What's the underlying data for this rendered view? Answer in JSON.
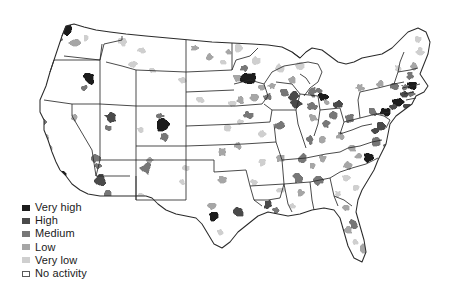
{
  "figure": {
    "type": "choropleth-map",
    "region": "United States (contiguous 48 states, county level)",
    "background_color": "#ffffff",
    "outline_color": "#2b2b2b",
    "title": ""
  },
  "legend": {
    "name": "activity-level-legend",
    "position": "bottom-left",
    "items": [
      {
        "label": "Very high",
        "color": "#1c1c1c",
        "rank": 5
      },
      {
        "label": "High",
        "color": "#4a4a4a",
        "rank": 4
      },
      {
        "label": "Medium",
        "color": "#777777",
        "rank": 3
      },
      {
        "label": "Low",
        "color": "#a6a6a6",
        "rank": 2
      },
      {
        "label": "Very low",
        "color": "#cfcfcf",
        "rank": 1
      },
      {
        "label": "No activity",
        "color": "#ffffff",
        "rank": 0
      }
    ]
  },
  "chart_data": {
    "type": "heatmap",
    "title": "",
    "xlabel": "",
    "ylabel": "",
    "legend_position": "bottom-left",
    "scale_labels": [
      "Very high",
      "High",
      "Medium",
      "Low",
      "Very low",
      "No activity"
    ],
    "scale_colors": [
      "#1c1c1c",
      "#4a4a4a",
      "#777777",
      "#a6a6a6",
      "#cfcfcf",
      "#ffffff"
    ],
    "default_level": "No activity",
    "regions": [
      {
        "name": "Seattle WA",
        "x": 64,
        "y": 28,
        "level": "Very high",
        "w": 14,
        "h": 14
      },
      {
        "name": "Puget Sound WA",
        "x": 58,
        "y": 40,
        "level": "Medium",
        "w": 11,
        "h": 8
      },
      {
        "name": "Portland OR",
        "x": 50,
        "y": 50,
        "level": "High",
        "w": 12,
        "h": 9
      },
      {
        "name": "Willamette OR",
        "x": 44,
        "y": 58,
        "level": "Medium",
        "w": 8,
        "h": 10
      },
      {
        "name": "Central WA",
        "x": 75,
        "y": 43,
        "level": "Low",
        "w": 12,
        "h": 7
      },
      {
        "name": "Spokane WA",
        "x": 86,
        "y": 38,
        "level": "Very low",
        "w": 7,
        "h": 6
      },
      {
        "name": "Boise ID",
        "x": 89,
        "y": 78,
        "level": "Very high",
        "w": 12,
        "h": 13
      },
      {
        "name": "SW Idaho",
        "x": 84,
        "y": 88,
        "level": "Medium",
        "w": 7,
        "h": 6
      },
      {
        "name": "Western MT",
        "x": 123,
        "y": 42,
        "level": "Very low",
        "w": 10,
        "h": 8
      },
      {
        "name": "Central MT",
        "x": 142,
        "y": 50,
        "level": "Very low",
        "w": 9,
        "h": 7
      },
      {
        "name": "Eastern MT",
        "x": 133,
        "y": 64,
        "level": "Very low",
        "w": 10,
        "h": 7
      },
      {
        "name": "Billings MT",
        "x": 152,
        "y": 70,
        "level": "Very low",
        "w": 7,
        "h": 6
      },
      {
        "name": "Western ND",
        "x": 195,
        "y": 48,
        "level": "Low",
        "w": 8,
        "h": 6
      },
      {
        "name": "Bismarck ND",
        "x": 210,
        "y": 57,
        "level": "Low",
        "w": 8,
        "h": 7
      },
      {
        "name": "Fargo ND",
        "x": 228,
        "y": 52,
        "level": "Low",
        "w": 7,
        "h": 6
      },
      {
        "name": "NE Montana",
        "x": 223,
        "y": 62,
        "level": "Very low",
        "w": 7,
        "h": 5
      },
      {
        "name": "Rapid City SD",
        "x": 182,
        "y": 80,
        "level": "Very low",
        "w": 8,
        "h": 6
      },
      {
        "name": "Sioux Falls SD",
        "x": 237,
        "y": 78,
        "level": "Low",
        "w": 9,
        "h": 8
      },
      {
        "name": "Minneapolis MN",
        "x": 248,
        "y": 78,
        "level": "Very high",
        "w": 15,
        "h": 13
      },
      {
        "name": "St Cloud MN",
        "x": 244,
        "y": 68,
        "level": "Medium",
        "w": 8,
        "h": 7
      },
      {
        "name": "Duluth MN",
        "x": 256,
        "y": 60,
        "level": "Very low",
        "w": 9,
        "h": 8
      },
      {
        "name": "NW Minnesota",
        "x": 238,
        "y": 48,
        "level": "Very low",
        "w": 9,
        "h": 9
      },
      {
        "name": "Rochester MN",
        "x": 262,
        "y": 88,
        "level": "Low",
        "w": 8,
        "h": 6
      },
      {
        "name": "La Crosse WI",
        "x": 272,
        "y": 86,
        "level": "Low",
        "w": 8,
        "h": 6
      },
      {
        "name": "Madison WI",
        "x": 284,
        "y": 92,
        "level": "Medium",
        "w": 9,
        "h": 8
      },
      {
        "name": "Milwaukee WI",
        "x": 294,
        "y": 96,
        "level": "High",
        "w": 10,
        "h": 9
      },
      {
        "name": "Green Bay WI",
        "x": 292,
        "y": 80,
        "level": "Low",
        "w": 8,
        "h": 7
      },
      {
        "name": "Northern WI",
        "x": 280,
        "y": 68,
        "level": "Very low",
        "w": 10,
        "h": 8
      },
      {
        "name": "Upper Peninsula MI",
        "x": 300,
        "y": 66,
        "level": "Very low",
        "w": 11,
        "h": 7
      },
      {
        "name": "Grand Rapids MI",
        "x": 312,
        "y": 92,
        "level": "Medium",
        "w": 9,
        "h": 9
      },
      {
        "name": "Detroit MI",
        "x": 323,
        "y": 97,
        "level": "Very high",
        "w": 10,
        "h": 9
      },
      {
        "name": "Lansing MI",
        "x": 318,
        "y": 90,
        "level": "Medium",
        "w": 7,
        "h": 6
      },
      {
        "name": "Chicago IL",
        "x": 296,
        "y": 104,
        "level": "High",
        "w": 11,
        "h": 10
      },
      {
        "name": "Northern IN",
        "x": 312,
        "y": 106,
        "level": "Medium",
        "w": 10,
        "h": 8
      },
      {
        "name": "Indianapolis IN",
        "x": 313,
        "y": 118,
        "level": "Low",
        "w": 9,
        "h": 8
      },
      {
        "name": "Cincinnati OH",
        "x": 326,
        "y": 124,
        "level": "Medium",
        "w": 9,
        "h": 8
      },
      {
        "name": "Columbus OH",
        "x": 334,
        "y": 115,
        "level": "Medium",
        "w": 9,
        "h": 8
      },
      {
        "name": "Cleveland OH",
        "x": 338,
        "y": 104,
        "level": "High",
        "w": 10,
        "h": 8
      },
      {
        "name": "Toledo OH",
        "x": 326,
        "y": 102,
        "level": "Low",
        "w": 7,
        "h": 6
      },
      {
        "name": "Des Moines IA",
        "x": 254,
        "y": 97,
        "level": "Low",
        "w": 9,
        "h": 8
      },
      {
        "name": "Cedar Rapids IA",
        "x": 268,
        "y": 97,
        "level": "Medium",
        "w": 8,
        "h": 7
      },
      {
        "name": "Omaha NE",
        "x": 240,
        "y": 100,
        "level": "Low",
        "w": 8,
        "h": 7
      },
      {
        "name": "Lincoln NE",
        "x": 232,
        "y": 104,
        "level": "Very low",
        "w": 8,
        "h": 6
      },
      {
        "name": "Western NE",
        "x": 200,
        "y": 100,
        "level": "Very low",
        "w": 8,
        "h": 6
      },
      {
        "name": "Kansas City MO",
        "x": 248,
        "y": 115,
        "level": "Medium",
        "w": 9,
        "h": 8
      },
      {
        "name": "Wichita KS",
        "x": 228,
        "y": 128,
        "level": "Very low",
        "w": 8,
        "h": 6
      },
      {
        "name": "Topeka KS",
        "x": 240,
        "y": 122,
        "level": "Very low",
        "w": 7,
        "h": 6
      },
      {
        "name": "St Louis MO",
        "x": 280,
        "y": 126,
        "level": "Medium",
        "w": 10,
        "h": 9
      },
      {
        "name": "Springfield MO",
        "x": 262,
        "y": 134,
        "level": "Very low",
        "w": 8,
        "h": 7
      },
      {
        "name": "Denver CO",
        "x": 162,
        "y": 124,
        "level": "Very high",
        "w": 13,
        "h": 14
      },
      {
        "name": "Colorado Springs",
        "x": 164,
        "y": 138,
        "level": "Medium",
        "w": 9,
        "h": 8
      },
      {
        "name": "Fort Collins CO",
        "x": 160,
        "y": 116,
        "level": "Medium",
        "w": 8,
        "h": 6
      },
      {
        "name": "Grand Junction CO",
        "x": 140,
        "y": 130,
        "level": "Very low",
        "w": 7,
        "h": 6
      },
      {
        "name": "Salt Lake City UT",
        "x": 110,
        "y": 118,
        "level": "High",
        "w": 11,
        "h": 10
      },
      {
        "name": "Provo UT",
        "x": 108,
        "y": 128,
        "level": "Medium",
        "w": 7,
        "h": 6
      },
      {
        "name": "Reno NV",
        "x": 74,
        "y": 118,
        "level": "Low",
        "w": 8,
        "h": 7
      },
      {
        "name": "Las Vegas NV",
        "x": 96,
        "y": 158,
        "level": "Medium",
        "w": 9,
        "h": 8
      },
      {
        "name": "Sacramento CA",
        "x": 42,
        "y": 122,
        "level": "Medium",
        "w": 9,
        "h": 9
      },
      {
        "name": "San Francisco CA",
        "x": 31,
        "y": 130,
        "level": "Very high",
        "w": 10,
        "h": 14
      },
      {
        "name": "San Jose CA",
        "x": 38,
        "y": 143,
        "level": "High",
        "w": 8,
        "h": 8
      },
      {
        "name": "Fresno CA",
        "x": 48,
        "y": 150,
        "level": "Low",
        "w": 9,
        "h": 9
      },
      {
        "name": "Central Valley CA",
        "x": 44,
        "y": 138,
        "level": "Low",
        "w": 8,
        "h": 8
      },
      {
        "name": "Los Angeles CA",
        "x": 50,
        "y": 162,
        "level": "High",
        "w": 12,
        "h": 11
      },
      {
        "name": "San Diego CA",
        "x": 62,
        "y": 176,
        "level": "Very high",
        "w": 10,
        "h": 9
      },
      {
        "name": "Santa Barbara CA",
        "x": 44,
        "y": 170,
        "level": "Medium",
        "w": 7,
        "h": 6
      },
      {
        "name": "Phoenix AZ",
        "x": 100,
        "y": 180,
        "level": "High",
        "w": 13,
        "h": 12
      },
      {
        "name": "Tucson AZ",
        "x": 108,
        "y": 194,
        "level": "Medium",
        "w": 9,
        "h": 8
      },
      {
        "name": "Flagstaff AZ",
        "x": 98,
        "y": 166,
        "level": "Medium",
        "w": 8,
        "h": 6
      },
      {
        "name": "Albuquerque NM",
        "x": 146,
        "y": 168,
        "level": "Medium",
        "w": 11,
        "h": 12
      },
      {
        "name": "Santa Fe NM",
        "x": 150,
        "y": 160,
        "level": "Low",
        "w": 7,
        "h": 6
      },
      {
        "name": "Las Cruces NM",
        "x": 140,
        "y": 196,
        "level": "Very low",
        "w": 8,
        "h": 7
      },
      {
        "name": "El Paso TX",
        "x": 150,
        "y": 200,
        "level": "Very low",
        "w": 7,
        "h": 6
      },
      {
        "name": "Amarillo TX",
        "x": 186,
        "y": 168,
        "level": "Very low",
        "w": 8,
        "h": 6
      },
      {
        "name": "Lubbock TX",
        "x": 182,
        "y": 182,
        "level": "Very low",
        "w": 7,
        "h": 6
      },
      {
        "name": "Oklahoma City OK",
        "x": 222,
        "y": 152,
        "level": "Low",
        "w": 9,
        "h": 8
      },
      {
        "name": "Tulsa OK",
        "x": 238,
        "y": 146,
        "level": "Low",
        "w": 8,
        "h": 7
      },
      {
        "name": "Dallas TX",
        "x": 222,
        "y": 180,
        "level": "Low",
        "w": 9,
        "h": 8
      },
      {
        "name": "Austin TX",
        "x": 212,
        "y": 206,
        "level": "Low",
        "w": 8,
        "h": 7
      },
      {
        "name": "San Antonio TX",
        "x": 214,
        "y": 216,
        "level": "Very high",
        "w": 10,
        "h": 9
      },
      {
        "name": "Houston TX",
        "x": 238,
        "y": 212,
        "level": "High",
        "w": 11,
        "h": 10
      },
      {
        "name": "Corpus Christi TX",
        "x": 220,
        "y": 232,
        "level": "Very low",
        "w": 7,
        "h": 6
      },
      {
        "name": "Little Rock AR",
        "x": 262,
        "y": 162,
        "level": "Very low",
        "w": 8,
        "h": 7
      },
      {
        "name": "Shreveport LA",
        "x": 254,
        "y": 182,
        "level": "Very low",
        "w": 7,
        "h": 6
      },
      {
        "name": "Baton Rouge LA",
        "x": 268,
        "y": 204,
        "level": "High",
        "w": 9,
        "h": 8
      },
      {
        "name": "New Orleans LA",
        "x": 276,
        "y": 210,
        "level": "Medium",
        "w": 9,
        "h": 7
      },
      {
        "name": "Jackson MS",
        "x": 280,
        "y": 190,
        "level": "Very low",
        "w": 8,
        "h": 7
      },
      {
        "name": "Memphis TN",
        "x": 280,
        "y": 158,
        "level": "Low",
        "w": 9,
        "h": 8
      },
      {
        "name": "Nashville TN",
        "x": 302,
        "y": 158,
        "level": "Medium",
        "w": 10,
        "h": 8
      },
      {
        "name": "Knoxville TN",
        "x": 322,
        "y": 158,
        "level": "Low",
        "w": 8,
        "h": 7
      },
      {
        "name": "Chattanooga TN",
        "x": 312,
        "y": 166,
        "level": "Low",
        "w": 7,
        "h": 6
      },
      {
        "name": "Birmingham AL",
        "x": 298,
        "y": 178,
        "level": "Medium",
        "w": 10,
        "h": 10
      },
      {
        "name": "Montgomery AL",
        "x": 300,
        "y": 192,
        "level": "Low",
        "w": 8,
        "h": 7
      },
      {
        "name": "Mobile AL",
        "x": 292,
        "y": 206,
        "level": "Very low",
        "w": 7,
        "h": 6
      },
      {
        "name": "Atlanta GA",
        "x": 318,
        "y": 180,
        "level": "Medium",
        "w": 10,
        "h": 9
      },
      {
        "name": "Savannah GA",
        "x": 338,
        "y": 194,
        "level": "Very low",
        "w": 7,
        "h": 6
      },
      {
        "name": "Louisville KY",
        "x": 310,
        "y": 140,
        "level": "Medium",
        "w": 9,
        "h": 8
      },
      {
        "name": "Lexington KY",
        "x": 322,
        "y": 140,
        "level": "Low",
        "w": 8,
        "h": 7
      },
      {
        "name": "Charleston WV",
        "x": 340,
        "y": 136,
        "level": "Low",
        "w": 8,
        "h": 7
      },
      {
        "name": "Pittsburgh PA",
        "x": 350,
        "y": 118,
        "level": "Medium",
        "w": 10,
        "h": 9
      },
      {
        "name": "Harrisburg PA",
        "x": 372,
        "y": 112,
        "level": "Medium",
        "w": 9,
        "h": 8
      },
      {
        "name": "Philadelphia PA",
        "x": 386,
        "y": 112,
        "level": "Very high",
        "w": 11,
        "h": 10
      },
      {
        "name": "Baltimore MD",
        "x": 380,
        "y": 126,
        "level": "High",
        "w": 9,
        "h": 8
      },
      {
        "name": "Washington DC",
        "x": 374,
        "y": 131,
        "level": "High",
        "w": 8,
        "h": 7
      },
      {
        "name": "Richmond VA",
        "x": 376,
        "y": 142,
        "level": "Medium",
        "w": 9,
        "h": 8
      },
      {
        "name": "Norfolk VA",
        "x": 386,
        "y": 146,
        "level": "Medium",
        "w": 8,
        "h": 7
      },
      {
        "name": "Roanoke VA",
        "x": 352,
        "y": 148,
        "level": "Low",
        "w": 8,
        "h": 7
      },
      {
        "name": "Raleigh NC",
        "x": 368,
        "y": 158,
        "level": "Very high",
        "w": 10,
        "h": 9
      },
      {
        "name": "Charlotte NC",
        "x": 348,
        "y": 166,
        "level": "Low",
        "w": 9,
        "h": 8
      },
      {
        "name": "Greensboro NC",
        "x": 358,
        "y": 156,
        "level": "Low",
        "w": 8,
        "h": 6
      },
      {
        "name": "Columbia SC",
        "x": 346,
        "y": 178,
        "level": "Very low",
        "w": 8,
        "h": 7
      },
      {
        "name": "Charleston SC",
        "x": 356,
        "y": 188,
        "level": "Very low",
        "w": 7,
        "h": 6
      },
      {
        "name": "Jacksonville FL",
        "x": 346,
        "y": 208,
        "level": "Low",
        "w": 8,
        "h": 7
      },
      {
        "name": "Orlando FL",
        "x": 354,
        "y": 224,
        "level": "Medium",
        "w": 9,
        "h": 9
      },
      {
        "name": "Tampa FL",
        "x": 348,
        "y": 230,
        "level": "Low",
        "w": 8,
        "h": 8
      },
      {
        "name": "Miami FL",
        "x": 364,
        "y": 248,
        "level": "Low",
        "w": 8,
        "h": 9
      },
      {
        "name": "Fort Myers FL",
        "x": 355,
        "y": 242,
        "level": "Very low",
        "w": 7,
        "h": 6
      },
      {
        "name": "New York NY",
        "x": 398,
        "y": 102,
        "level": "Very high",
        "w": 12,
        "h": 10
      },
      {
        "name": "Long Island NY",
        "x": 408,
        "y": 106,
        "level": "High",
        "w": 9,
        "h": 6
      },
      {
        "name": "Newark NJ",
        "x": 393,
        "y": 107,
        "level": "High",
        "w": 7,
        "h": 7
      },
      {
        "name": "Albany NY",
        "x": 394,
        "y": 86,
        "level": "Medium",
        "w": 9,
        "h": 8
      },
      {
        "name": "Syracuse NY",
        "x": 380,
        "y": 84,
        "level": "Low",
        "w": 8,
        "h": 7
      },
      {
        "name": "Buffalo NY",
        "x": 360,
        "y": 88,
        "level": "Low",
        "w": 8,
        "h": 7
      },
      {
        "name": "Hartford CT",
        "x": 404,
        "y": 94,
        "level": "High",
        "w": 8,
        "h": 7
      },
      {
        "name": "Providence RI",
        "x": 412,
        "y": 94,
        "level": "Medium",
        "w": 7,
        "h": 6
      },
      {
        "name": "Boston MA",
        "x": 412,
        "y": 86,
        "level": "Very high",
        "w": 10,
        "h": 8
      },
      {
        "name": "Worcester MA",
        "x": 405,
        "y": 87,
        "level": "Medium",
        "w": 7,
        "h": 5
      },
      {
        "name": "Manchester NH",
        "x": 410,
        "y": 76,
        "level": "Medium",
        "w": 7,
        "h": 7
      },
      {
        "name": "Burlington VT",
        "x": 398,
        "y": 68,
        "level": "Very low",
        "w": 7,
        "h": 7
      },
      {
        "name": "Portland ME",
        "x": 414,
        "y": 66,
        "level": "Low",
        "w": 7,
        "h": 7
      },
      {
        "name": "Bangor ME",
        "x": 420,
        "y": 52,
        "level": "Very low",
        "w": 8,
        "h": 9
      },
      {
        "name": "Northern ME",
        "x": 418,
        "y": 40,
        "level": "Very low",
        "w": 7,
        "h": 8
      }
    ]
  }
}
